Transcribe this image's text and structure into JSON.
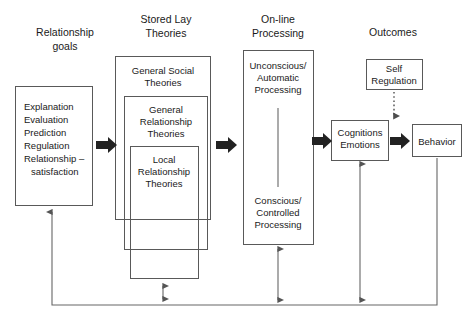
{
  "figure": {
    "background_color": "#ffffff",
    "line_color": "#595959",
    "text_color": "#1a1a1a",
    "arrow_color": "#222222"
  },
  "columns": [
    {
      "id": "relationship-goals",
      "line1": "Relationship",
      "line2": "goals"
    },
    {
      "id": "stored-lay-theories",
      "line1": "Stored Lay",
      "line2": "Theories"
    },
    {
      "id": "online-processing",
      "line1": "On-line",
      "line2": "Processing"
    },
    {
      "id": "outcomes",
      "line1": "Outcomes",
      "line2": ""
    }
  ],
  "goals_box": {
    "name": "relationship-goals-box",
    "items": [
      "Explanation",
      "Evaluation",
      "Prediction",
      "Regulation",
      "Relationship –"
    ],
    "sub_item": "satisfaction"
  },
  "theory_boxes": [
    {
      "id": "general-social-theories",
      "line1": "General Social",
      "line2": "Theories",
      "line3": ""
    },
    {
      "id": "general-relationship-theories",
      "line1": "General",
      "line2": "Relationship",
      "line3": "Theories"
    },
    {
      "id": "local-relationship-theories",
      "line1": "Local",
      "line2": "Relationship",
      "line3": "Theories"
    }
  ],
  "processing_box": {
    "name": "online-processing-box",
    "top": {
      "line1": "Unconscious/",
      "line2": "Automatic",
      "line3": "Processing"
    },
    "bottom": {
      "line1": "Conscious/",
      "line2": "Controlled",
      "line3": "Processing"
    }
  },
  "outcome_boxes": [
    {
      "id": "self-regulation",
      "line1": "Self",
      "line2": "Regulation"
    },
    {
      "id": "cognitions-emotions",
      "line1": "Cognitions",
      "line2": "Emotions"
    },
    {
      "id": "behavior",
      "line1": "Behavior",
      "line2": ""
    }
  ],
  "connectors": [
    {
      "id": "goals-to-theories",
      "style": "block-arrow",
      "direction": "right"
    },
    {
      "id": "theories-to-processing",
      "style": "block-arrow",
      "direction": "right"
    },
    {
      "id": "processing-to-cognitions",
      "style": "block-arrow",
      "direction": "right"
    },
    {
      "id": "cognitions-to-behavior",
      "style": "block-arrow",
      "direction": "right"
    },
    {
      "id": "self-regulation-to-cognitions",
      "style": "dotted-arrow",
      "direction": "down"
    },
    {
      "id": "theories-internal-exchange",
      "style": "double-arrow",
      "direction": "vertical"
    },
    {
      "id": "processing-feedback",
      "style": "double-arrow",
      "direction": "vertical"
    },
    {
      "id": "cognitions-feedback",
      "style": "double-arrow",
      "direction": "vertical"
    },
    {
      "id": "behavior-return-loop",
      "style": "line-with-arrow",
      "direction": "left-then-up"
    }
  ]
}
